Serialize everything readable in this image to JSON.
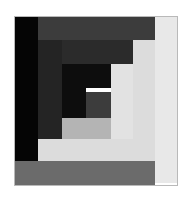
{
  "artwork": {
    "title": "Log Cabin Block",
    "canvas": {
      "width": 193,
      "height": 200,
      "background": "#ffffff"
    },
    "frame": {
      "x": 14,
      "y": 16,
      "width": 164,
      "height": 170,
      "border_color": "#b9b9b9",
      "border_width": 1
    },
    "palette": {
      "black": "#050505",
      "near_black": "#0d0d0d",
      "dark_charcoal": "#242424",
      "charcoal": "#2b2b2b",
      "dark_gray": "#3c3c3c",
      "mid_gray": "#6b6b6b",
      "warm_gray": "#7a7a7a",
      "light_mid_gray": "#b4b4b4",
      "light_gray": "#dcdcdc",
      "pale_gray": "#e2e2e2",
      "off_white": "#e8e8e8"
    },
    "blocks": [
      {
        "name": "strip-left-black-outer",
        "x": 14,
        "y": 16,
        "w": 24,
        "h": 155,
        "color": "#050505",
        "tone": "black"
      },
      {
        "name": "strip-top-dark-gray-outer",
        "x": 38,
        "y": 16,
        "w": 117,
        "h": 24,
        "color": "#3c3c3c",
        "tone": "dark_gray"
      },
      {
        "name": "strip-right-light-outer",
        "x": 155,
        "y": 16,
        "w": 23,
        "h": 167,
        "color": "#e8e8e8",
        "tone": "off_white"
      },
      {
        "name": "strip-bottom-mid-gray-outer",
        "x": 14,
        "y": 161,
        "w": 141,
        "h": 25,
        "color": "#6b6b6b",
        "tone": "mid_gray"
      },
      {
        "name": "strip-left-charcoal-ring2",
        "x": 38,
        "y": 40,
        "w": 24,
        "h": 121,
        "color": "#242424",
        "tone": "dark_charcoal"
      },
      {
        "name": "strip-top-charcoal-ring2",
        "x": 62,
        "y": 40,
        "w": 78,
        "h": 24,
        "color": "#2b2b2b",
        "tone": "charcoal"
      },
      {
        "name": "strip-right-light-ring2",
        "x": 133,
        "y": 40,
        "w": 22,
        "h": 121,
        "color": "#dcdcdc",
        "tone": "light_gray"
      },
      {
        "name": "strip-bottom-light-ring2",
        "x": 38,
        "y": 139,
        "w": 95,
        "h": 22,
        "color": "#dcdcdc",
        "tone": "light_gray"
      },
      {
        "name": "strip-left-black-ring3",
        "x": 62,
        "y": 64,
        "w": 24,
        "h": 75,
        "color": "#0d0d0d",
        "tone": "near_black"
      },
      {
        "name": "strip-top-black-ring3",
        "x": 62,
        "y": 64,
        "w": 49,
        "h": 24,
        "color": "#0d0d0d",
        "tone": "near_black"
      },
      {
        "name": "strip-right-pale-ring3",
        "x": 111,
        "y": 64,
        "w": 22,
        "h": 75,
        "color": "#e2e2e2",
        "tone": "pale_gray"
      },
      {
        "name": "strip-bottom-light-mid-ring3",
        "x": 62,
        "y": 118,
        "w": 49,
        "h": 21,
        "color": "#b4b4b4",
        "tone": "light_mid_gray"
      },
      {
        "name": "core-square-warm-gray",
        "x": 86,
        "y": 92,
        "w": 25,
        "h": 26,
        "color": "#3c3c3c",
        "tone": "dark_gray"
      }
    ]
  }
}
